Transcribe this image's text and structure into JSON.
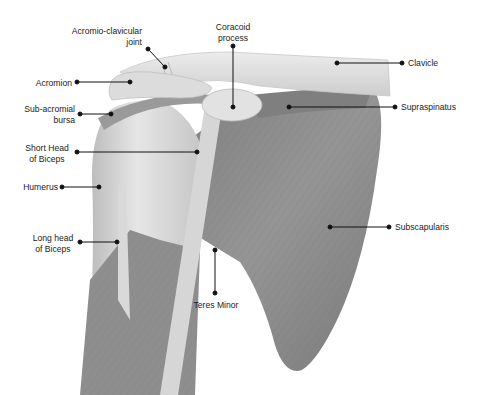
{
  "diagram": {
    "labels": {
      "ac_joint": {
        "line1": "Acromio-clavicular",
        "line2": "joint"
      },
      "coracoid": {
        "line1": "Coracoid",
        "line2": "process"
      },
      "acromion": {
        "line1": "Acromion"
      },
      "clavicle": {
        "line1": "Clavicle"
      },
      "bursa": {
        "line1": "Sub-acromial",
        "line2": "bursa"
      },
      "supraspinatus": {
        "line1": "Supraspinatus"
      },
      "short_head": {
        "line1": "Short Head",
        "line2": "of Biceps"
      },
      "humerus": {
        "line1": "Humerus"
      },
      "subscapularis": {
        "line1": "Subscapularis"
      },
      "long_head": {
        "line1": "Long head",
        "line2": "of Biceps"
      },
      "teres_minor": {
        "line1": "Teres Minor"
      }
    },
    "colors": {
      "bone_light": "#e4e4e4",
      "bone_mid": "#cfcfcf",
      "muscle": "#8a8a8a",
      "muscle_dark": "#6f6f6f",
      "leader": "#111111"
    }
  }
}
